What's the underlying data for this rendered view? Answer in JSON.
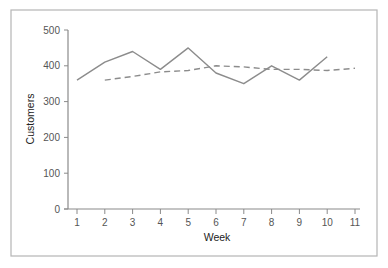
{
  "chart_data": {
    "type": "line",
    "title": "",
    "xlabel": "Week",
    "ylabel": "Customers",
    "x": [
      1,
      2,
      3,
      4,
      5,
      6,
      7,
      8,
      9,
      10,
      11
    ],
    "xticks": [
      "1",
      "2",
      "3",
      "4",
      "5",
      "6",
      "7",
      "8",
      "9",
      "10",
      "11"
    ],
    "yticks": [
      "0",
      "100",
      "200",
      "300",
      "400",
      "500"
    ],
    "ylim": [
      0,
      500
    ],
    "xlim": [
      1,
      11
    ],
    "grid": false,
    "legend": null,
    "series": [
      {
        "name": "Customers",
        "style": "solid",
        "color": "#8c8c8c",
        "x": [
          1,
          2,
          3,
          4,
          5,
          6,
          7,
          8,
          9,
          10
        ],
        "values": [
          360,
          410,
          440,
          390,
          450,
          380,
          350,
          400,
          360,
          425
        ]
      },
      {
        "name": "Moving average",
        "style": "dashed",
        "color": "#8c8c8c",
        "x": [
          2,
          3,
          4,
          5,
          6,
          7,
          8,
          9,
          10,
          11
        ],
        "values": [
          360,
          370,
          383,
          387,
          400,
          397,
          390,
          390,
          387,
          393
        ]
      }
    ]
  },
  "colors": {
    "frame": "#b5b5b5",
    "axis": "#8a8a8a",
    "series": "#8c8c8c",
    "text": "#555555"
  }
}
